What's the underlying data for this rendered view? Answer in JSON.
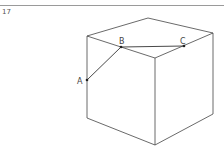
{
  "question": {
    "number": "17"
  },
  "figure": {
    "shape": "cube",
    "points": [
      {
        "id": "A",
        "label": "A",
        "location": "left vertical edge, front-left face"
      },
      {
        "id": "B",
        "label": "B",
        "location": "top-left edge of top face"
      },
      {
        "id": "C",
        "label": "C",
        "location": "top-right edge of top face"
      }
    ],
    "segments": [
      {
        "from": "A",
        "to": "B"
      },
      {
        "from": "B",
        "to": "C"
      }
    ],
    "colors": {
      "edge": "#444444",
      "segment": "#333333",
      "rule": "#9a9a9a"
    }
  }
}
